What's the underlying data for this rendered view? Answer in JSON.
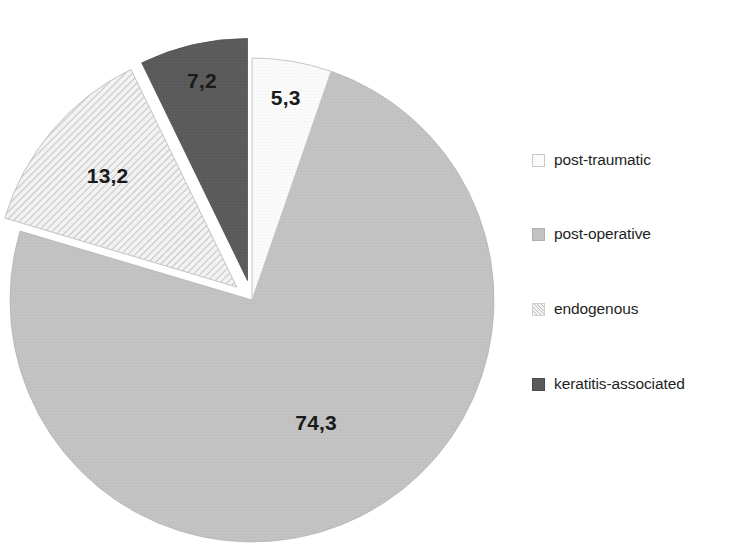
{
  "chart_data": {
    "type": "pie",
    "title": "",
    "subtitle": "",
    "xlabel": "",
    "ylabel": "",
    "decimal_separator": ",",
    "units": "percent",
    "legend_position": "right",
    "grid": false,
    "start_angle_deg": 0,
    "direction": "clockwise",
    "categories": [
      "post-traumatic",
      "post-operative",
      "endogenous",
      "keratitis-associated"
    ],
    "values": [
      5.3,
      74.3,
      13.2,
      7.2
    ],
    "value_labels": [
      "5,3",
      "74,3",
      "13,2",
      "7,2"
    ],
    "slices": [
      {
        "label": "post-traumatic",
        "value": 5.3,
        "value_label": "5,3",
        "color": "#fbfbfb",
        "pattern": "solid",
        "exploded": false,
        "start_deg": 0.0,
        "sweep_deg": 19.08
      },
      {
        "label": "post-operative",
        "value": 74.3,
        "value_label": "74,3",
        "color": "#c2c2c2",
        "pattern": "solid",
        "exploded": false,
        "start_deg": 19.08,
        "sweep_deg": 267.48
      },
      {
        "label": "endogenous",
        "value": 13.2,
        "value_label": "13,2",
        "color": "#f1f1f1",
        "pattern": "diagonal-hatch",
        "exploded": true,
        "start_deg": 286.56,
        "sweep_deg": 47.52
      },
      {
        "label": "keratitis-associated",
        "value": 7.2,
        "value_label": "7,2",
        "color": "#5b5b5b",
        "pattern": "solid",
        "exploded": true,
        "start_deg": 334.08,
        "sweep_deg": 25.92
      }
    ]
  },
  "legend": {
    "items": [
      {
        "label": "post-traumatic",
        "swatch": "swatch-post-traumatic",
        "color": "#fbfbfb"
      },
      {
        "label": "post-operative",
        "swatch": "swatch-post-operative",
        "color": "#c2c2c2"
      },
      {
        "label": "endogenous",
        "swatch": "swatch-endogenous",
        "color": "#f1f1f1"
      },
      {
        "label": "keratitis-associated",
        "swatch": "swatch-keratitis-associated",
        "color": "#5b5b5b"
      }
    ]
  },
  "labels": {
    "post_traumatic": "5,3",
    "post_operative": "74,3",
    "endogenous": "13,2",
    "keratitis_associated": "7,2"
  },
  "colors": {
    "background": "#ffffff",
    "text": "#231f20",
    "post_traumatic": "#fbfbfb",
    "post_operative": "#c2c2c2",
    "endogenous": "#f1f1f1",
    "keratitis_associated": "#5b5b5b"
  }
}
